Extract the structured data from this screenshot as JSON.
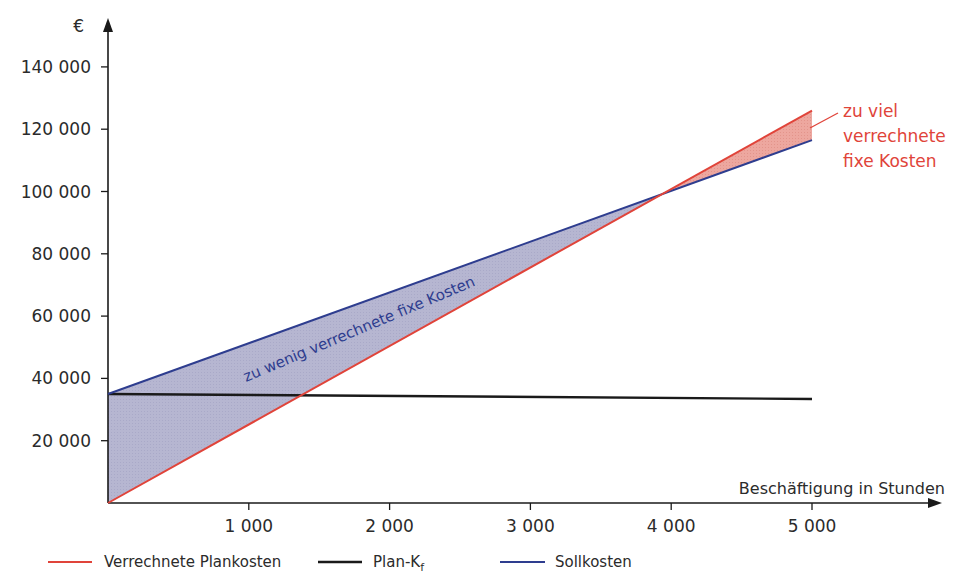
{
  "chart_data": {
    "type": "line",
    "title": "",
    "xlabel": "Beschäftigung in Stunden",
    "ylabel": "€",
    "xlim": [
      0,
      5000
    ],
    "ylim": [
      0,
      140000
    ],
    "x_ticks": [
      1000,
      2000,
      3000,
      4000,
      5000
    ],
    "x_tick_labels": [
      "1 000",
      "2 000",
      "3 000",
      "4 000",
      "5 000"
    ],
    "y_ticks": [
      20000,
      40000,
      60000,
      80000,
      100000,
      120000,
      140000
    ],
    "y_tick_labels": [
      "20 000",
      "40 000",
      "60 000",
      "80 000",
      "100 000",
      "120 000",
      "140 000"
    ],
    "grid": false,
    "legend_position": "bottom",
    "x": [
      0,
      5000
    ],
    "series": [
      {
        "name": "Verrechnete Plankosten",
        "color": "#e0443a",
        "values": [
          0,
          126000
        ]
      },
      {
        "name": "Plan-Kf",
        "color": "#1a1a1a",
        "values": [
          35000,
          33400
        ]
      },
      {
        "name": "Sollkosten",
        "color": "#2e3d8f",
        "values": [
          35000,
          116500
        ]
      }
    ],
    "intersection": {
      "x": 3950,
      "y": 100000
    },
    "annotations": [
      {
        "text": "zu wenig verrechnete fixe Kosten",
        "region": "0–3950 h, between Sollkosten and Verrechnete Plankosten",
        "fill": "#b9b9d3"
      },
      {
        "text": "zu viel verrechnete fixe Kosten",
        "region": "3950–5000 h, between Verrechnete Plankosten and Sollkosten",
        "fill": "#eca59d"
      }
    ]
  },
  "labels": {
    "y_unit": "€",
    "x_title": "Beschäftigung in Stunden",
    "under_label": "zu wenig verrechnete fixe Kosten",
    "over_label_line1": "zu viel",
    "over_label_line2": "verrechnete",
    "over_label_line3": "fixe Kosten"
  },
  "legend": {
    "items": [
      {
        "label": "Verrechnete Plankosten",
        "color": "#e0443a"
      },
      {
        "label_main": "Plan-K",
        "label_sub": "f",
        "color": "#1a1a1a"
      },
      {
        "label": "Sollkosten",
        "color": "#2e3d8f"
      }
    ]
  }
}
